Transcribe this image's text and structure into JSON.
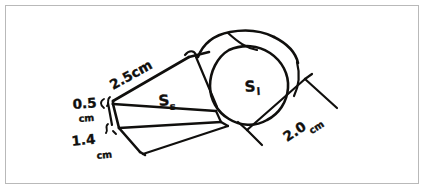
{
  "figure": {
    "background_color": "#ffffff",
    "ink_color": "#100f0d",
    "border_color": "#b9b9b9"
  },
  "labels": {
    "length_top": {
      "value": "2.5",
      "unit": "cm",
      "full": "2.5cm",
      "name": "prism-length-label"
    },
    "height_left": {
      "value": "0.5",
      "unit": "cm",
      "full": "0.5 cm",
      "name": "prism-height-label"
    },
    "depth_left": {
      "value": "1.4",
      "unit": "cm",
      "full": "1.4 cm",
      "name": "prism-depth-label"
    },
    "diameter_right": {
      "value": "2.0",
      "unit": "cm",
      "full": "2.0 cm",
      "name": "cylinder-diameter-label"
    }
  },
  "surface_labels": {
    "small_face": {
      "base": "S",
      "subscript": "s",
      "full": "Ss",
      "meaning": "surface area of small prism face"
    },
    "large_face": {
      "base": "S",
      "subscript": "l",
      "full": "Sl",
      "meaning": "surface area of large circular face"
    }
  },
  "shapes": [
    {
      "name": "rectangular-prism",
      "description": "slanted box forming the whistle body"
    },
    {
      "name": "cylinder",
      "description": "round head of the whistle"
    },
    {
      "name": "dimension-brackets",
      "description": "tick marks indicating measured edges"
    }
  ]
}
